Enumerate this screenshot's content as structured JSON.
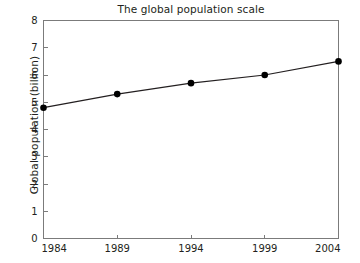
{
  "chart_data": {
    "type": "line",
    "title": "The global population scale",
    "xlabel": "",
    "ylabel": "Global population (billion)",
    "categories": [
      "1984",
      "1989",
      "1994",
      "1999",
      "2004"
    ],
    "x": [
      1984,
      1989,
      1994,
      1999,
      2004
    ],
    "values": [
      4.8,
      5.3,
      5.7,
      6.0,
      6.5
    ],
    "series": [
      {
        "name": "Global population",
        "values": [
          4.8,
          5.3,
          5.7,
          6.0,
          6.5
        ]
      }
    ],
    "xlim": [
      1984,
      2004
    ],
    "ylim": [
      0,
      8
    ],
    "y_ticks": [
      "0",
      "1",
      "2",
      "3",
      "4",
      "5",
      "6",
      "7",
      "8"
    ],
    "x_ticks": [
      "1984",
      "1989",
      "1994",
      "1999",
      "2004"
    ],
    "grid": false,
    "legend": false,
    "legend_position": "none",
    "marker": "filled-circle",
    "line_color": "#231f20",
    "marker_color": "#000000",
    "axis_color": "#7b7b7b",
    "background_color": "#ffffff"
  },
  "figure": {
    "title": "The global population scale",
    "y_axis_title": "Global population (billion)"
  }
}
